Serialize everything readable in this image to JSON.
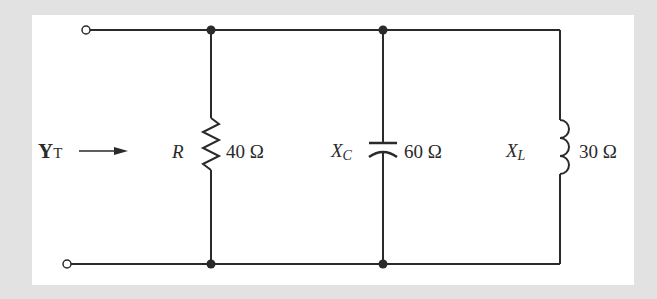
{
  "diagram": {
    "type": "parallel-circuit",
    "colors": {
      "background": "#e2e2e2",
      "panel": "#ffffff",
      "wire": "#2a2a2a"
    },
    "input": {
      "symbol": "Y",
      "subscript": "T",
      "arrow": "right-arrow"
    },
    "branches": [
      {
        "component": "resistor",
        "symbol": "R",
        "subscript": "",
        "value": "40 Ω"
      },
      {
        "component": "capacitor",
        "symbol": "X",
        "subscript": "C",
        "value": "60 Ω"
      },
      {
        "component": "inductor",
        "symbol": "X",
        "subscript": "L",
        "value": "30 Ω"
      }
    ]
  }
}
